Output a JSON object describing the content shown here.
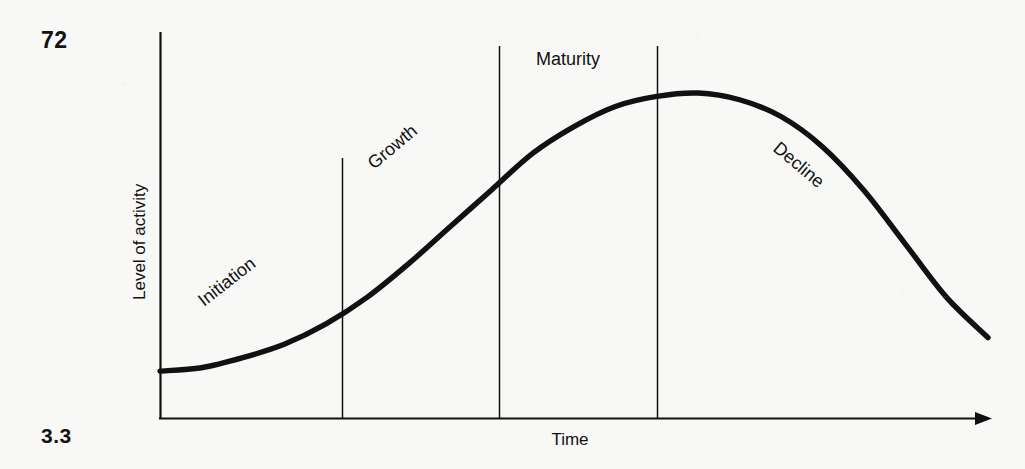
{
  "page": {
    "page_number": "72",
    "figure_number": "3.3",
    "background_color": "#f8f8f6",
    "ink_color": "#111111"
  },
  "chart_data": {
    "type": "line",
    "title": "",
    "subtitle": "",
    "xlabel": "Time",
    "ylabel": "Level of activity",
    "grid": false,
    "legend_position": "none",
    "axis": {
      "x_axis_has_arrow": true,
      "y_axis_has_arrow": false,
      "x_tick_labels": [],
      "y_tick_labels": [],
      "xlim": [
        0,
        100
      ],
      "ylim": [
        0,
        100
      ]
    },
    "series": [
      {
        "name": "Level of activity",
        "x": [
          0,
          5,
          10,
          15,
          20,
          25,
          30,
          35,
          40,
          45,
          50,
          55,
          60,
          65,
          70,
          75,
          80,
          85,
          90,
          95,
          100
        ],
        "values": [
          14,
          15,
          18,
          22,
          28,
          36,
          46,
          57,
          68,
          79,
          87,
          93,
          96,
          97,
          95,
          90,
          81,
          68,
          52,
          36,
          24
        ]
      }
    ],
    "phase_dividers": [
      {
        "name": "initiation-growth-divider",
        "x": 22
      },
      {
        "name": "growth-maturity-divider",
        "x": 41
      },
      {
        "name": "maturity-decline-divider",
        "x": 60
      }
    ],
    "annotations": [
      {
        "name": "initiation",
        "label": "Initiation",
        "rotation": -38
      },
      {
        "name": "growth",
        "label": "Growth",
        "rotation": -40
      },
      {
        "name": "maturity",
        "label": "Maturity",
        "rotation": 0
      },
      {
        "name": "decline",
        "label": "Decline",
        "rotation": 40
      }
    ]
  }
}
